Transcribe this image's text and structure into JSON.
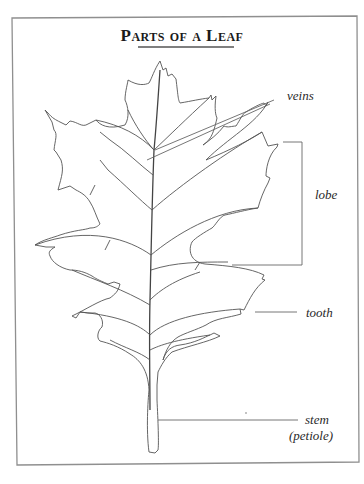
{
  "title": "Parts of a Leaf",
  "labels": {
    "veins": "veins",
    "lobe": "lobe",
    "tooth": "tooth",
    "stem": "stem",
    "petiole": "(petiole)"
  },
  "colors": {
    "frame": "#8a8a8a",
    "line": "#555555",
    "text": "#2a2a2a"
  }
}
